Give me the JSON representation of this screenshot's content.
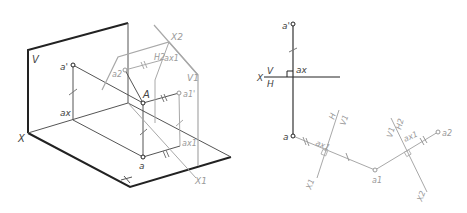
{
  "diagram": {
    "left_view": {
      "description": "Isometric view of point A projected onto planes V, H, and auxiliary planes V1, H2",
      "planes": [
        "V",
        "H",
        "V1",
        "H2"
      ],
      "axes": [
        "X",
        "X1",
        "X2"
      ],
      "points": [
        "a'",
        "a",
        "ax",
        "A",
        "a1'",
        "ax1",
        "a2",
        "ax1"
      ],
      "labels": {
        "V": "V",
        "X": "X",
        "H": "H",
        "a_prime": "a'",
        "ax": "ax",
        "A": "A",
        "a": "a",
        "a1_prime": "a1'",
        "ax1": "ax1",
        "X1": "X1",
        "X2": "X2",
        "H2": "H2",
        "ax1_upper": "ax1",
        "a2": "a2",
        "V1": "V1"
      }
    },
    "right_view": {
      "description": "Orthographic epure with replaced projection planes",
      "labels": {
        "a_prime": "a'",
        "ax": "ax",
        "X": "X",
        "V_over": "V",
        "H_under": "H",
        "a": "a",
        "ax1_left": "ax1",
        "H_left": "H",
        "V1_left": "V1",
        "X1": "X1",
        "a1": "a1",
        "V1_right": "V1",
        "H2_right": "H2",
        "ax1_right": "ax1",
        "a2": "a2",
        "X2": "X2"
      }
    },
    "colors": {
      "primary_line": "#222222",
      "secondary_line": "#555555",
      "auxiliary_line": "#a8a8a8",
      "label": "#444444",
      "background": "#ffffff"
    }
  }
}
